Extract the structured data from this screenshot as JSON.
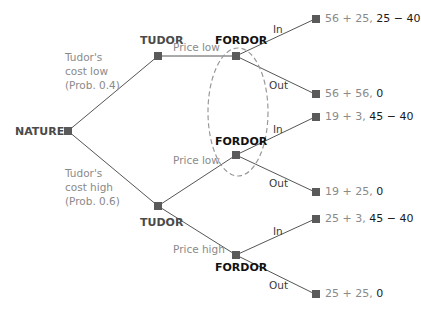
{
  "colors": {
    "node": "#5a5a5a",
    "edge": "#555555",
    "ellipse": "#999999",
    "tudor_payoff": "#8a8a8a",
    "fordor_payoff": "#1a1a1a"
  },
  "nodes": {
    "nature": {
      "label": "NATURE"
    },
    "tudor_low": {
      "label": "TUDOR"
    },
    "tudor_high": {
      "label": "TUDOR"
    },
    "fordor_1": {
      "label": "FORDOR"
    },
    "fordor_2": {
      "label": "FORDOR"
    },
    "fordor_3": {
      "label": "FORDOR"
    }
  },
  "nature_branches": {
    "low": {
      "line1": "Tudor's",
      "line2": "cost low",
      "line3": "(Prob. 0.4)"
    },
    "high": {
      "line1": "Tudor's",
      "line2": "cost high",
      "line3": "(Prob. 0.6)"
    }
  },
  "actions": {
    "tudor_low_price": "Price low",
    "tudor_high_price_low": "Price low",
    "tudor_high_price_high": "Price high",
    "f1_in": "In",
    "f1_out": "Out",
    "f2_in": "In",
    "f2_out": "Out",
    "f3_in": "In",
    "f3_out": "Out"
  },
  "payoffs": [
    {
      "tudor": "56 + 25,",
      "fordor": "25 − 40"
    },
    {
      "tudor": "56 + 56,",
      "fordor": "0"
    },
    {
      "tudor": "19 + 3,",
      "fordor": "45 − 40"
    },
    {
      "tudor": "19 + 25,",
      "fordor": "0"
    },
    {
      "tudor": "25 + 3,",
      "fordor": "45 − 40"
    },
    {
      "tudor": "25 + 25,",
      "fordor": "0"
    }
  ]
}
